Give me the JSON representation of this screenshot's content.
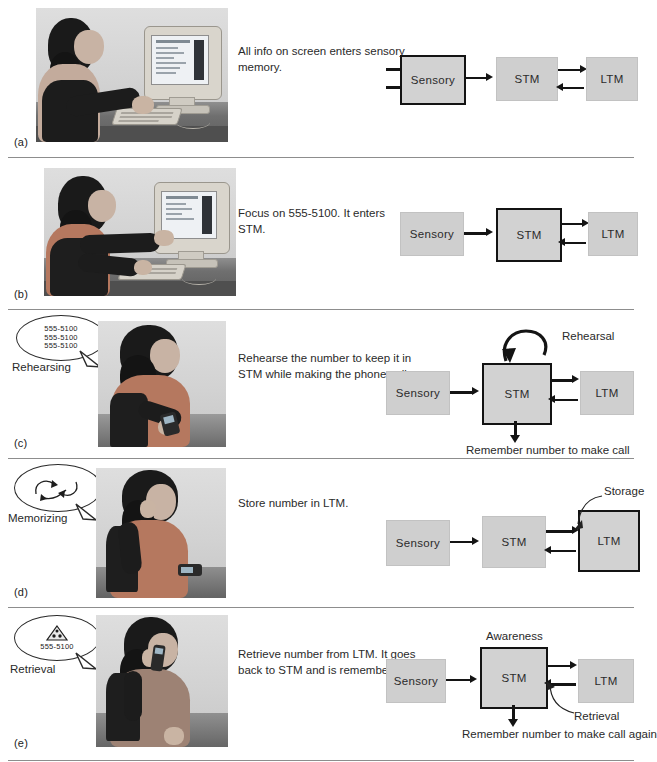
{
  "figure": {
    "stage_boxes": [
      "Sensory",
      "STM",
      "LTM"
    ]
  },
  "panels": [
    {
      "label": "(a)",
      "caption": "All info on screen enters sensory memory.",
      "photo_alt": "Woman seated at a desk typing on a keyboard, looking at a computer monitor",
      "active_box": "Sensory",
      "diagram": {
        "boxes": [
          "Sensory",
          "STM",
          "LTM"
        ],
        "annotations": [],
        "input_arrows": 2
      }
    },
    {
      "label": "(b)",
      "caption": "Focus on 555-5100. It enters STM.",
      "photo_alt": "Woman pointing at a phone number on the computer screen",
      "active_box": "STM",
      "diagram": {
        "boxes": [
          "Sensory",
          "STM",
          "LTM"
        ],
        "annotations": [],
        "input_arrows": 0
      }
    },
    {
      "label": "(c)",
      "caption": "Rehearse the number to keep it in STM while making the phone call.",
      "photo_alt": "Woman seated, dialing a mobile phone while repeating the number",
      "active_box": "STM",
      "bubble": {
        "state_label": "Rehearsing",
        "lines": [
          "555-5100",
          "555-5100",
          "555-5100"
        ],
        "icon": "none"
      },
      "diagram": {
        "boxes": [
          "Sensory",
          "STM",
          "LTM"
        ],
        "annotations": [
          {
            "name": "rehearsal-loop-label",
            "text": "Rehearsal"
          },
          {
            "name": "output-label",
            "text": "Remember number to make call"
          }
        ],
        "input_arrows": 0
      }
    },
    {
      "label": "(d)",
      "caption": "Store number in LTM.",
      "photo_alt": "Woman holding the phone to her ear with hand at temple, concentrating",
      "active_box": "LTM",
      "bubble": {
        "state_label": "Memorizing",
        "lines": [],
        "icon": "swirl-arrows-icon"
      },
      "diagram": {
        "boxes": [
          "Sensory",
          "STM",
          "LTM"
        ],
        "annotations": [
          {
            "name": "storage-label",
            "text": "Storage"
          }
        ],
        "input_arrows": 0
      }
    },
    {
      "label": "(e)",
      "caption": "Retrieve number from LTM. It goes back to STM and is remembered.",
      "photo_alt": "Woman talking on a mobile phone at a desk",
      "active_box": "STM",
      "bubble": {
        "state_label": "Retrieval",
        "lines": [
          "555-5100"
        ],
        "icon": "pizza-slice-icon"
      },
      "diagram": {
        "boxes": [
          "Sensory",
          "STM",
          "LTM"
        ],
        "annotations": [
          {
            "name": "awareness-label",
            "text": "Awareness"
          },
          {
            "name": "retrieval-label",
            "text": "Retrieval"
          },
          {
            "name": "output-label",
            "text": "Remember number to make call again"
          }
        ],
        "input_arrows": 0
      }
    }
  ],
  "colors": {
    "box_fill": "#cfcfcf",
    "box_active_border": "#131313",
    "arrow": "#141414",
    "rule": "#8d8d8d",
    "text": "#2a2a2a"
  }
}
